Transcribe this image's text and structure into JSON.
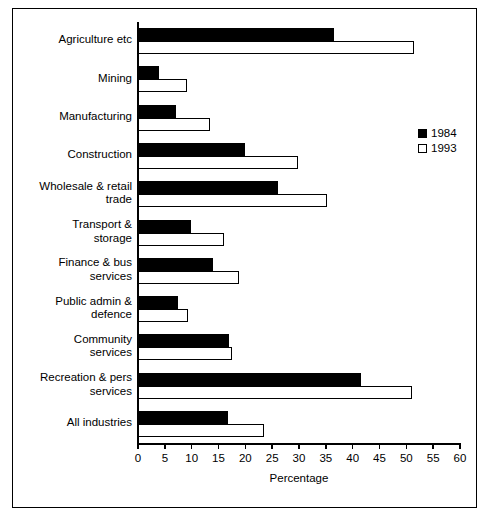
{
  "chart_data": {
    "type": "bar",
    "orientation": "horizontal",
    "title": "",
    "xlabel": "Percentage",
    "ylabel": "",
    "xlim": [
      0,
      60
    ],
    "xticks": [
      0,
      5,
      10,
      15,
      20,
      25,
      30,
      35,
      40,
      45,
      50,
      55,
      60
    ],
    "grid": false,
    "legend_position": "right",
    "categories": [
      "Agriculture etc",
      "Mining",
      "Manufacturing",
      "Construction",
      "Wholesale & retail trade",
      "Transport & storage",
      "Finance & bus services",
      "Public admin & defence",
      "Community services",
      "Recreation & pers services",
      "All industries"
    ],
    "category_lines": [
      [
        "Agriculture etc"
      ],
      [
        "Mining"
      ],
      [
        "Manufacturing"
      ],
      [
        "Construction"
      ],
      [
        "Wholesale & retail",
        "trade"
      ],
      [
        "Transport &",
        "storage"
      ],
      [
        "Finance & bus",
        "services"
      ],
      [
        "Public admin &",
        "defence"
      ],
      [
        "Community",
        "services"
      ],
      [
        "Recreation & pers",
        "services"
      ],
      [
        "All industries"
      ]
    ],
    "series": [
      {
        "name": "1984",
        "color": "#000000",
        "style": "filled",
        "values": [
          36.5,
          4.0,
          7.0,
          20.0,
          26.0,
          9.8,
          14.0,
          7.5,
          17.0,
          41.5,
          16.8
        ]
      },
      {
        "name": "1993",
        "color": "#ffffff",
        "style": "hollow",
        "values": [
          51.5,
          9.2,
          13.5,
          29.8,
          35.3,
          16.0,
          18.8,
          9.3,
          17.5,
          51.0,
          23.5
        ]
      }
    ]
  },
  "legend": {
    "entries": [
      {
        "label": "1984",
        "style": "filled"
      },
      {
        "label": "1993",
        "style": "hollow"
      }
    ]
  },
  "axis": {
    "x_title": "Percentage"
  }
}
